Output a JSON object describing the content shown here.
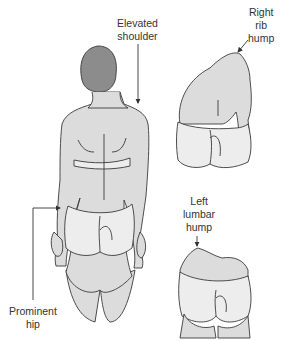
{
  "figure": {
    "colors": {
      "skin": "#dcdcdc",
      "underwear": "#ededed",
      "hair": "#8c8c8c",
      "outline": "#3a3a3a",
      "text": "#333333"
    }
  },
  "labels": {
    "elevated_shoulder": {
      "line1": "Elevated",
      "line2": "shoulder"
    },
    "right_rib_hump": {
      "line1": "Right",
      "line2": "rib",
      "line3": "hump"
    },
    "left_lumbar_hump": {
      "line1": "Left",
      "line2": "lumbar",
      "line3": "hump"
    },
    "prominent_hip": {
      "line1": "Prominent",
      "line2": "hip"
    }
  }
}
